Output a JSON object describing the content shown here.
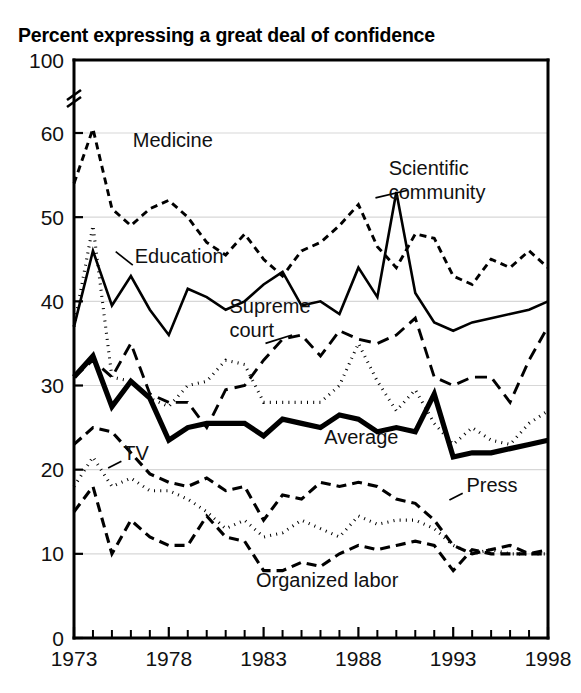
{
  "chart_data": {
    "type": "line",
    "title": "Percent expressing a great deal of confidence",
    "xlabel": "",
    "ylabel": "",
    "grid": true,
    "legend_position": "inline-labels",
    "xlim": [
      1973,
      1998
    ],
    "ylim": [
      0,
      60
    ],
    "y_axis_break": true,
    "y_axis_break_top_value": 100,
    "ytick_labels": [
      "0",
      "10",
      "20",
      "30",
      "40",
      "50",
      "60",
      "100"
    ],
    "ytick_values": [
      0,
      10,
      20,
      30,
      40,
      50,
      60,
      100
    ],
    "xtick_labels": [
      "1973",
      "1978",
      "1983",
      "1988",
      "1993",
      "1998"
    ],
    "xtick_values": [
      1973,
      1978,
      1983,
      1988,
      1993,
      1998
    ],
    "x_minor_ticks_every": 1,
    "x": [
      1973,
      1974,
      1975,
      1976,
      1977,
      1978,
      1979,
      1980,
      1981,
      1982,
      1983,
      1984,
      1985,
      1986,
      1987,
      1988,
      1989,
      1990,
      1991,
      1992,
      1993,
      1994,
      1995,
      1996,
      1997,
      1998
    ],
    "series": [
      {
        "name": "Medicine",
        "style": "dashed",
        "width": 2.9,
        "dash": "7,5",
        "label": "Medicine",
        "label_x": 1976.1,
        "label_y": 58.3,
        "leader": null,
        "values": [
          54,
          60.5,
          51,
          49,
          51,
          52,
          50,
          47,
          45.5,
          48,
          45,
          43,
          46,
          47,
          49,
          51.5,
          46.5,
          44,
          48,
          47.5,
          43,
          42,
          45,
          44,
          46,
          44
        ]
      },
      {
        "name": "Scientific community",
        "style": "solid",
        "width": 2.6,
        "dash": null,
        "label": "Scientific\ncommunity",
        "label_x": 1989.6,
        "label_y": 55.0,
        "leader": [
          1988.9,
          52.3,
          1990.6,
          53.2
        ],
        "values": [
          37,
          46,
          39.5,
          43,
          39,
          36,
          41.5,
          40.5,
          39,
          40,
          42,
          43.5,
          39.5,
          40,
          38.5,
          44,
          40.5,
          53,
          41,
          37.5,
          36.5,
          37.5,
          38,
          38.5,
          39,
          40
        ]
      },
      {
        "name": "Education",
        "style": "dotted",
        "width": 3.1,
        "dash": "1,5.2",
        "label": "Education",
        "label_x": 1976.2,
        "label_y": 44.6,
        "leader": [
          1975.2,
          45.9,
          1976.1,
          44.3
        ],
        "values": [
          37,
          49,
          31,
          30.5,
          28.5,
          27.5,
          30,
          30.5,
          33,
          32.5,
          28,
          28,
          28,
          28,
          30,
          35,
          30.5,
          27,
          29.5,
          25.5,
          23,
          25,
          23.5,
          23,
          25.5,
          27
        ]
      },
      {
        "name": "Supreme court",
        "style": "long-dashed",
        "width": 2.9,
        "dash": "12,7",
        "label": "Supreme\ncourt",
        "label_x": 1981.2,
        "label_y": 38.6,
        "leader": [
          1983.1,
          35.0,
          1984.5,
          36.0
        ],
        "values": [
          31,
          33,
          31,
          35,
          29,
          28,
          28,
          25,
          29.5,
          30,
          33,
          35.5,
          36,
          33.5,
          36.5,
          35.5,
          35,
          36,
          38,
          31,
          30,
          31,
          31,
          28,
          33,
          37
        ]
      },
      {
        "name": "Average",
        "style": "solid",
        "width": 5.2,
        "dash": null,
        "label": "Average",
        "label_x": 1986.2,
        "label_y": 23.0,
        "leader": null,
        "values": [
          31,
          33.5,
          27.5,
          30.5,
          28.5,
          23.5,
          25,
          25.5,
          25.5,
          25.5,
          24,
          26,
          25.5,
          25,
          26.5,
          26,
          24.5,
          25,
          24.5,
          29,
          21.5,
          22,
          22,
          22.5,
          23,
          23.5
        ]
      },
      {
        "name": "TV",
        "style": "dotted",
        "width": 3.1,
        "dash": "1,5.2",
        "label": "TV",
        "label_x": 1975.6,
        "label_y": 21.1,
        "leader": [
          1974.8,
          20.2,
          1975.5,
          21.0
        ],
        "values": [
          18,
          21.5,
          18,
          19,
          17.5,
          17.5,
          16.5,
          15,
          13,
          14,
          12,
          12.5,
          14,
          13,
          12,
          14.5,
          13.5,
          14,
          14,
          13,
          11,
          10,
          10.5,
          10,
          10,
          10
        ]
      },
      {
        "name": "Press",
        "style": "dashed",
        "width": 3.1,
        "dash": "10,6",
        "label": "Press",
        "label_x": 1993.7,
        "label_y": 17.4,
        "leader": [
          1992.8,
          16.4,
          1993.5,
          17.2
        ],
        "values": [
          23,
          25,
          24.5,
          22,
          19.5,
          18.5,
          18,
          19,
          17.5,
          18,
          14,
          17,
          16.5,
          18.5,
          18,
          18.5,
          18,
          16.5,
          16,
          14,
          11,
          10,
          10.5,
          11,
          10,
          10
        ]
      },
      {
        "name": "Organized labor",
        "style": "dashed",
        "width": 3.1,
        "dash": "10,6",
        "label": "Organized labor",
        "label_x": 1982.6,
        "label_y": 6.1,
        "leader": null,
        "values": [
          15,
          18,
          10,
          14,
          12,
          11,
          11,
          14.5,
          12,
          11.5,
          8,
          8,
          9,
          8.5,
          10,
          11,
          10.5,
          11,
          11.5,
          11,
          8,
          10.5,
          10,
          10,
          10,
          10.5
        ]
      }
    ]
  }
}
